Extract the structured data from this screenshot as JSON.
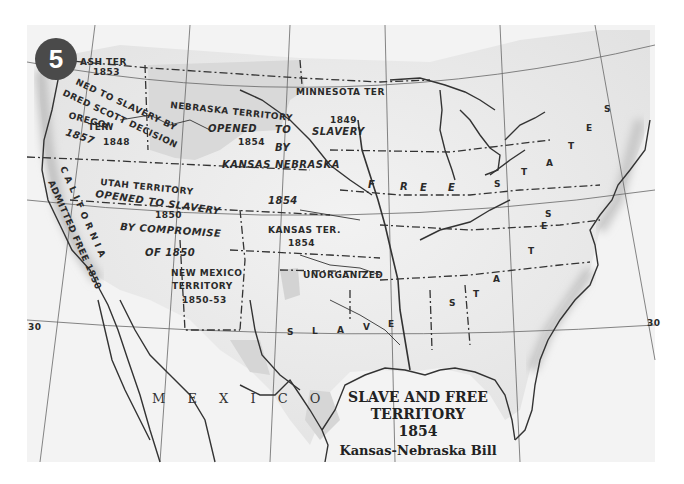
{
  "badge": {
    "number": "5"
  },
  "title": {
    "line1": "SLAVE AND FREE",
    "line2": "TERRITORY",
    "year": "1854",
    "subtitle": "Kansas-Nebraska Bill"
  },
  "regions": {
    "wash": {
      "name": "ASH  TER",
      "year": "1853"
    },
    "oregon": {
      "name": "OREGON",
      "name2": "TER.",
      "year": "1848"
    },
    "dred_scott": {
      "line1": "NED TO SLAVERY BY",
      "line2": "DRED SCOTT DECISION",
      "year": "1857"
    },
    "nebraska": {
      "name": "NEBRASKA TERRITORY",
      "opened": "OPENED",
      "to": "TO",
      "year": "1854",
      "by": "BY",
      "bill1": "KANSAS NEBRASKA",
      "bill2": "BILL",
      "bill_year": "1854"
    },
    "minnesota": {
      "name": "MINNESOTA  TER",
      "year": "1849",
      "slavery": "SLAVERY"
    },
    "utah": {
      "name": "UTAH TERRITORY",
      "opened": "OPENED TO SLAVERY",
      "year": "1850",
      "by": "BY COMPROMISE",
      "of": "OF 1850"
    },
    "california": {
      "name": "C A L I F O R N I A",
      "admitted": "ADMITTED FREE 1850"
    },
    "new_mexico": {
      "name": "NEW MEXICO",
      "name2": "TERRITORY",
      "years": "1850-53"
    },
    "kansas": {
      "name": "KANSAS TER.",
      "year": "1854"
    },
    "unorganized": {
      "name": "UNORGANIZED"
    },
    "free_states": {
      "letters": [
        "F",
        "R",
        "E",
        "E",
        "S",
        "T",
        "A",
        "T",
        "E",
        "S"
      ]
    },
    "slave_states": {
      "letters": [
        "S",
        "L",
        "A",
        "V",
        "E",
        "S",
        "T",
        "A",
        "T",
        "E",
        "S"
      ]
    },
    "mexico": {
      "name": "M E X I C O"
    }
  },
  "graticule": {
    "left_lat": "30",
    "right_lat": "30"
  }
}
